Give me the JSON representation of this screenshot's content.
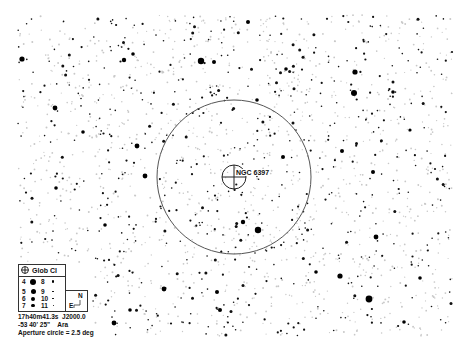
{
  "chart": {
    "field": {
      "x0": 18,
      "y0": 15,
      "x1": 452,
      "y1": 336,
      "faint_star_count": 1300,
      "dark_star_count": 620,
      "seed": 6397
    },
    "aperture_circle": {
      "cx": 234,
      "cy": 177,
      "r": 77,
      "color": "#555555"
    },
    "target": {
      "name": "NGC 6397",
      "cx": 234,
      "cy": 177,
      "r": 12,
      "label_x": 236,
      "label_y": 169
    },
    "bright_stars": [
      {
        "x": 22,
        "y": 59,
        "r": 2.6
      },
      {
        "x": 55,
        "y": 108,
        "r": 2.4
      },
      {
        "x": 124,
        "y": 60,
        "r": 2.2
      },
      {
        "x": 133,
        "y": 54,
        "r": 1.8
      },
      {
        "x": 201,
        "y": 61,
        "r": 3.2
      },
      {
        "x": 214,
        "y": 62,
        "r": 2.0
      },
      {
        "x": 248,
        "y": 22,
        "r": 2.0
      },
      {
        "x": 283,
        "y": 157,
        "r": 2.0
      },
      {
        "x": 286,
        "y": 69,
        "r": 1.8
      },
      {
        "x": 145,
        "y": 176,
        "r": 2.4
      },
      {
        "x": 137,
        "y": 146,
        "r": 2.4
      },
      {
        "x": 258,
        "y": 230,
        "r": 3.2
      },
      {
        "x": 243,
        "y": 222,
        "r": 2.2
      },
      {
        "x": 355,
        "y": 72,
        "r": 2.6
      },
      {
        "x": 354,
        "y": 93,
        "r": 3.0
      },
      {
        "x": 373,
        "y": 172,
        "r": 2.0
      },
      {
        "x": 342,
        "y": 151,
        "r": 2.0
      },
      {
        "x": 164,
        "y": 289,
        "r": 2.4
      },
      {
        "x": 217,
        "y": 292,
        "r": 2.0
      },
      {
        "x": 369,
        "y": 299,
        "r": 3.4
      },
      {
        "x": 340,
        "y": 276,
        "r": 2.6
      },
      {
        "x": 376,
        "y": 237,
        "r": 2.4
      },
      {
        "x": 114,
        "y": 323,
        "r": 2.4
      },
      {
        "x": 220,
        "y": 310,
        "r": 2.0
      },
      {
        "x": 130,
        "y": 310,
        "r": 1.8
      },
      {
        "x": 420,
        "y": 278,
        "r": 1.8
      },
      {
        "x": 393,
        "y": 92,
        "r": 1.8
      },
      {
        "x": 410,
        "y": 130,
        "r": 1.6
      },
      {
        "x": 83,
        "y": 132,
        "r": 1.8
      },
      {
        "x": 56,
        "y": 188,
        "r": 1.8
      },
      {
        "x": 105,
        "y": 225,
        "r": 1.8
      },
      {
        "x": 316,
        "y": 272,
        "r": 1.8
      },
      {
        "x": 257,
        "y": 100,
        "r": 1.8
      },
      {
        "x": 404,
        "y": 322,
        "r": 1.8
      }
    ]
  },
  "legend": {
    "title": "Glob Cl",
    "icon": "globular-cluster-icon",
    "magnitudes": [
      {
        "mag": "4",
        "size": 6.0
      },
      {
        "mag": "5",
        "size": 5.0
      },
      {
        "mag": "6",
        "size": 4.0
      },
      {
        "mag": "7",
        "size": 3.2
      },
      {
        "mag": "8",
        "size": 2.6
      },
      {
        "mag": "9",
        "size": 1.8
      },
      {
        "mag": "10",
        "size": 1.4
      },
      {
        "mag": "11",
        "size": 1.0
      }
    ],
    "compass": {
      "north": "N",
      "east": "E"
    }
  },
  "info": {
    "ra": "17h40m41.3s",
    "epoch": "J2000.0",
    "dec": "-53 40' 25\"",
    "constellation": "Ara",
    "aperture": "Aperture circle = 2.5 deg"
  }
}
